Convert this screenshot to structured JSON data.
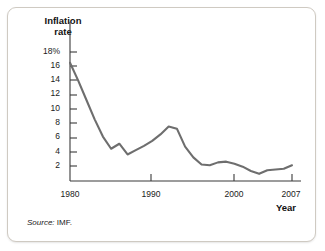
{
  "figure": {
    "source_note_prefix": "Source:",
    "source_note_value": "IMF.",
    "border_color": "#cfcac2",
    "background": "#ffffff"
  },
  "chart_data": {
    "type": "line",
    "title": "",
    "subtitle": "",
    "xlabel": "Year",
    "ylabel": "Inflation rate",
    "ylabel_line1": "Inflation",
    "ylabel_line2": "rate",
    "line_color": "#6e6e6e",
    "axis_color": "#3a3a3a",
    "grid": false,
    "legend": false,
    "xlim": [
      1980,
      2007
    ],
    "ylim": [
      0,
      18
    ],
    "ytick_labels": [
      "18%",
      "16",
      "14",
      "12",
      "10",
      "8",
      "6",
      "4",
      "2"
    ],
    "ytick_values": [
      18,
      16,
      14,
      12,
      10,
      8,
      6,
      4,
      2
    ],
    "xtick_labels": [
      "1980",
      "1990",
      "2000",
      "2007"
    ],
    "xtick_values": [
      1980,
      1990,
      2000,
      2007
    ],
    "x": [
      1980,
      1981,
      1982,
      1983,
      1984,
      1985,
      1986,
      1987,
      1988,
      1989,
      1990,
      1991,
      1992,
      1993,
      1994,
      1995,
      1996,
      1997,
      1998,
      1999,
      2000,
      2001,
      2002,
      2003,
      2004,
      2005,
      2006,
      2007
    ],
    "values": [
      16.5,
      14.0,
      11.3,
      8.6,
      6.2,
      4.5,
      5.2,
      3.7,
      4.3,
      4.9,
      5.6,
      6.5,
      7.6,
      7.3,
      4.8,
      3.3,
      2.3,
      2.2,
      2.6,
      2.7,
      2.4,
      2.0,
      1.4,
      1.0,
      1.5,
      1.6,
      1.7,
      2.2
    ],
    "series_name": "Inflation rate"
  }
}
